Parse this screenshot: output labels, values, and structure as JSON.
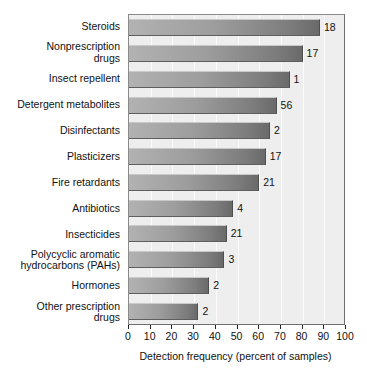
{
  "chart_data": {
    "type": "bar",
    "orientation": "horizontal",
    "title": "",
    "xlabel": "Detection frequency (percent of samples)",
    "ylabel": "",
    "xlim": [
      0,
      100
    ],
    "xticks": [
      0,
      10,
      20,
      30,
      40,
      50,
      60,
      70,
      80,
      90,
      100
    ],
    "xtick_labels": [
      "0",
      "10",
      "20",
      "30",
      "40",
      "50",
      "60",
      "70",
      "80",
      "90",
      "100"
    ],
    "grid": true,
    "grid_axis": "x",
    "legend": null,
    "categories": [
      "Steroids",
      "Nonprescription\ndrugs",
      "Insect repellent",
      "Detergent metabolites",
      "Disinfectants",
      "Plasticizers",
      "Fire retardants",
      "Antibiotics",
      "Insecticides",
      "Polycyclic aromatic\nhydrocarbons (PAHs)",
      "Hormones",
      "Other prescription\ndrugs"
    ],
    "values": [
      88,
      80,
      74,
      68,
      65,
      63,
      60,
      48,
      45,
      44,
      37,
      32
    ],
    "annotations": [
      "18",
      "17",
      "1",
      "56",
      "2",
      "17",
      "21",
      "4",
      "21",
      "3",
      "2",
      "2"
    ],
    "annotation_note": "number of compounds measured in each category",
    "bars": [
      {
        "label": "Steroids",
        "value": 88,
        "annotation": "18"
      },
      {
        "label": "Nonprescription\ndrugs",
        "value": 80,
        "annotation": "17"
      },
      {
        "label": "Insect repellent",
        "value": 74,
        "annotation": "1"
      },
      {
        "label": "Detergent metabolites",
        "value": 68,
        "annotation": "56"
      },
      {
        "label": "Disinfectants",
        "value": 65,
        "annotation": "2"
      },
      {
        "label": "Plasticizers",
        "value": 63,
        "annotation": "17"
      },
      {
        "label": "Fire retardants",
        "value": 60,
        "annotation": "21"
      },
      {
        "label": "Antibiotics",
        "value": 48,
        "annotation": "4"
      },
      {
        "label": "Insecticides",
        "value": 45,
        "annotation": "21"
      },
      {
        "label": "Polycyclic aromatic\nhydrocarbons (PAHs)",
        "value": 44,
        "annotation": "3"
      },
      {
        "label": "Hormones",
        "value": 37,
        "annotation": "2"
      },
      {
        "label": "Other prescription\ndrugs",
        "value": 32,
        "annotation": "2"
      }
    ],
    "colors": {
      "bar_gradient_start": "#b2b2b2",
      "bar_gradient_end": "#6a6a6a",
      "plot_background": "#eeeeee",
      "gridline": "#fbfbfb",
      "axis": "#222222",
      "text": "#111111",
      "page_background": "#ffffff"
    }
  }
}
